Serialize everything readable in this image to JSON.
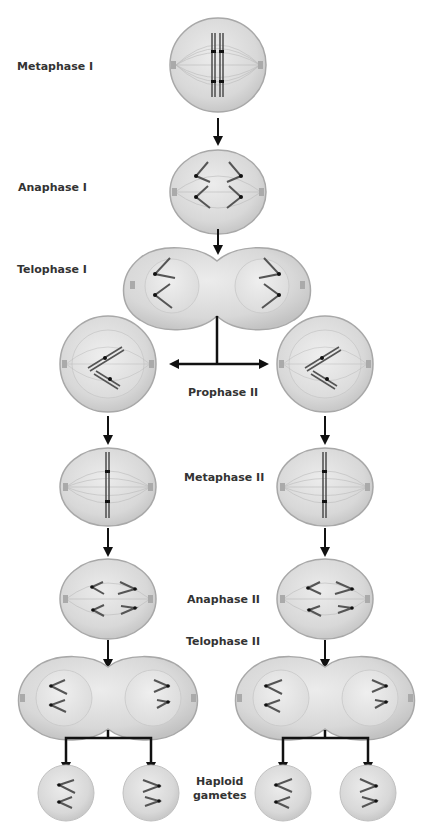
{
  "diagram": {
    "colors": {
      "cell_fill": "#d9d9d9",
      "cell_edge": "#a8a8a8",
      "nucleus_fill": "#e6e6e6",
      "chromosome": "#555555",
      "centromere": "#111111",
      "arrow": "#111111",
      "label": "#333333"
    },
    "stages": [
      {
        "id": "metaphase-1",
        "label": "Metaphase I"
      },
      {
        "id": "anaphase-1",
        "label": "Anaphase I"
      },
      {
        "id": "telophase-1",
        "label": "Telophase I"
      },
      {
        "id": "prophase-2",
        "label": "Prophase II"
      },
      {
        "id": "metaphase-2",
        "label": "Metaphase II"
      },
      {
        "id": "anaphase-2",
        "label": "Anaphase II"
      },
      {
        "id": "telophase-2",
        "label": "Telophase II"
      },
      {
        "id": "gametes",
        "label_line1": "Haploid",
        "label_line2": "gametes"
      }
    ]
  }
}
